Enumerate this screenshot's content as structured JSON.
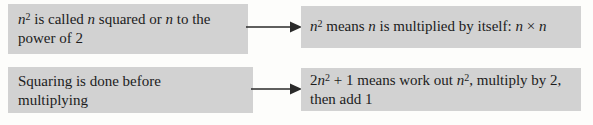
{
  "colors": {
    "page_bg": "#fdfdfb",
    "box_bg": "#d2d2d2",
    "text": "#1c1c1c",
    "arrow": "#2a2a2a"
  },
  "icons": [
    {
      "name": "right-arrow-icon",
      "glyph": "→"
    },
    {
      "name": "right-arrow-icon",
      "glyph": "→"
    }
  ],
  "boxes": [
    {
      "name": "note-n-squared-naming",
      "plain_text": "n2 is called n squared or n to the power of 2",
      "lines": [
        [
          {
            "t": "n",
            "i": true
          },
          {
            "t": "2",
            "sup": true
          },
          {
            "t": " is called "
          },
          {
            "t": "n",
            "i": true
          },
          {
            "t": " squared or "
          },
          {
            "t": "n",
            "i": true
          },
          {
            "t": " to the"
          }
        ],
        [
          {
            "t": "power of 2"
          }
        ]
      ]
    },
    {
      "name": "note-n-squared-meaning",
      "plain_text": "n2 means n is multiplied by itself: n × n",
      "lines": [
        [
          {
            "t": "n",
            "i": true
          },
          {
            "t": "2",
            "sup": true
          },
          {
            "t": " means "
          },
          {
            "t": "n",
            "i": true
          },
          {
            "t": " is multiplied by itself: "
          },
          {
            "t": "n",
            "i": true
          },
          {
            "t": " × "
          },
          {
            "t": "n",
            "i": true
          }
        ]
      ]
    },
    {
      "name": "note-squaring-order",
      "plain_text": "Squaring is done before multiplying",
      "lines": [
        [
          {
            "t": "Squaring is done before"
          }
        ],
        [
          {
            "t": "multiplying"
          }
        ]
      ]
    },
    {
      "name": "note-two-n-squared-plus-one",
      "plain_text": "2n2 + 1 means work out n2, multiply by 2, then add 1",
      "lines": [
        [
          {
            "t": "2"
          },
          {
            "t": "n",
            "i": true
          },
          {
            "t": "2",
            "sup": true
          },
          {
            "t": " + 1 means work out "
          },
          {
            "t": "n",
            "i": true
          },
          {
            "t": "2",
            "sup": true
          },
          {
            "t": ", multiply by 2,"
          }
        ],
        [
          {
            "t": "then add 1"
          }
        ]
      ]
    }
  ]
}
